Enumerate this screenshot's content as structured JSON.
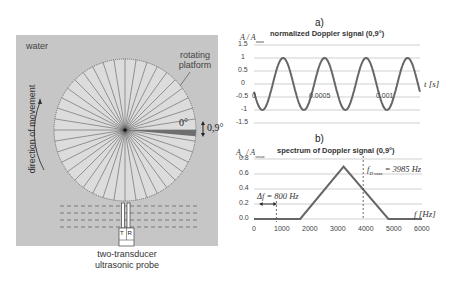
{
  "left_diagram": {
    "medium_label": "water",
    "platform_label_line1": "rotating",
    "platform_label_line2": "platform",
    "direction_label": "direction of movement",
    "sector_start_label": "0°",
    "sector_width_label": "0,9°",
    "probe_transducers": {
      "transmit": "T",
      "receive": "R"
    },
    "probe_label_line1": "two-transducer",
    "probe_label_line2": "ultrasonic probe",
    "spoke_count": 40,
    "colors": {
      "panel_bg": "#c8c8c8",
      "disc_fill": "#dcdcdc",
      "sector_fill": "#6e6e6e",
      "lines": "#444444"
    }
  },
  "chart_data": [
    {
      "panel_label": "a)",
      "type": "line",
      "title": "normalized Doppler signal (0,9°)",
      "ylabel": "A / Amax",
      "ylabel_main": "A / A",
      "ylabel_sub": "max",
      "xlabel": "t [s]",
      "ylim": [
        -1.5,
        1.5
      ],
      "yticks": [
        "1.5",
        "1",
        "0.5",
        "0",
        "-0.5",
        "-1",
        "-1.5"
      ],
      "xticks": [
        "0",
        "0.0005",
        "0.001"
      ],
      "xlim": [
        0,
        0.00125
      ],
      "grid": true,
      "series": [
        {
          "name": "signal",
          "frequency_hz": 3200,
          "amplitude": 1.0,
          "phase_start_value": -0.3,
          "x": [
            0,
            8e-05,
            0.00023,
            0.00039,
            0.00055,
            0.0007,
            0.00086,
            0.00101,
            0.00117,
            0.00125
          ],
          "y": [
            -0.3,
            -1,
            1,
            -1,
            1,
            -1,
            1,
            -1,
            1,
            0
          ]
        }
      ],
      "color": "#666666"
    },
    {
      "panel_label": "b)",
      "type": "line",
      "title": "spectrum of Doppler signal (0,9°)",
      "ylabel": "Aw / Awmax",
      "ylabel_main": "A",
      "ylabel_sub1": "w",
      "ylabel_mid": " / A",
      "ylabel_sub2": "wmax",
      "xlabel": "f [Hz]",
      "xlim": [
        0,
        6000
      ],
      "ylim": [
        0,
        0.8
      ],
      "xticks": [
        "0",
        "1000",
        "2000",
        "3000",
        "4000",
        "5000",
        "6000"
      ],
      "yticks": [
        "0.8",
        "0.6",
        "0.4",
        "0.2",
        "0.0"
      ],
      "grid": true,
      "series": [
        {
          "name": "spectrum",
          "x": [
            0,
            1650,
            3200,
            4800,
            6000
          ],
          "y": [
            0,
            0,
            0.7,
            0,
            0
          ]
        }
      ],
      "annotations": [
        {
          "text": "f Dmax = 3985 Hz",
          "main": "f",
          "sub": "D max",
          "rest": " = 3985 Hz",
          "x": 3985,
          "style": "dashed-vertical"
        },
        {
          "text": "Δf = 800 Hz",
          "value": "Δf = 800 Hz",
          "x_from": 200,
          "x_to": 800,
          "y": 0.2,
          "style": "double-arrow"
        }
      ],
      "color": "#666666"
    }
  ]
}
